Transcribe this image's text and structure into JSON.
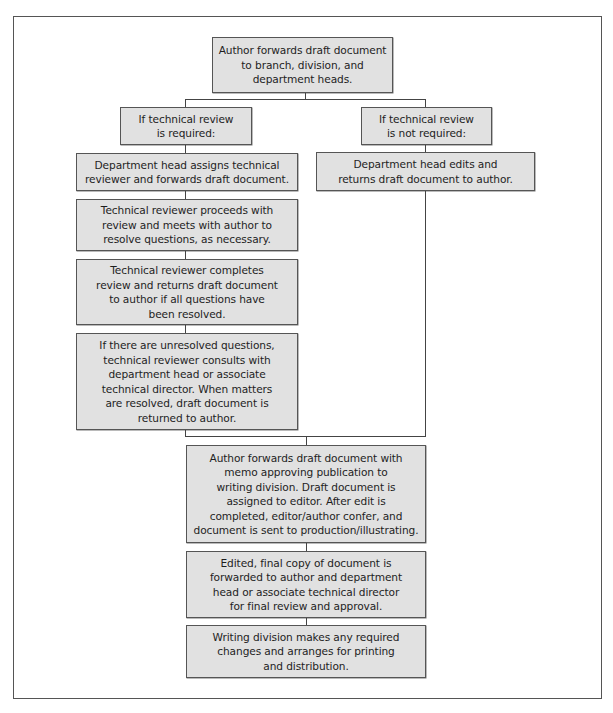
{
  "diagram": {
    "type": "flowchart",
    "style": {
      "node_fill": "#e1e1e1",
      "node_border": "#555555",
      "line_color": "#444444",
      "frame_border": "#555555"
    },
    "nodes": {
      "start": {
        "text": "Author forwards draft document\nto branch, division, and\ndepartment heads."
      },
      "review_required": {
        "text": "If technical review\nis required:"
      },
      "review_not_required": {
        "text": "If technical review\nis not required:"
      },
      "assign_reviewer": {
        "text": "Department head assigns technical\nreviewer and forwards draft document."
      },
      "dept_head_edits": {
        "text": "Department head edits and\nreturns draft document to author."
      },
      "reviewer_proceeds": {
        "text": "Technical reviewer proceeds with\nreview and meets with author to\nresolve questions, as necessary."
      },
      "reviewer_completes": {
        "text": "Technical reviewer completes\nreview and returns draft document\nto author if all questions have\nbeen resolved."
      },
      "unresolved": {
        "text": "If there are unresolved questions,\ntechnical reviewer consults with\ndepartment head or associate\ntechnical director. When matters\nare resolved, draft document is\nreturned to author."
      },
      "forward_to_writing": {
        "text": "Author forwards draft document with\nmemo approving publication to\nwriting division. Draft document is\nassigned to editor. After edit is\ncompleted, editor/author confer, and\ndocument is sent to production/illustrating."
      },
      "final_copy": {
        "text": "Edited, final copy of document is\nforwarded to author and department\nhead or associate technical director\nfor final review and approval."
      },
      "printing": {
        "text": "Writing division makes any required\nchanges and arranges for printing\nand distribution."
      }
    },
    "edges": [
      [
        "start",
        "review_required"
      ],
      [
        "start",
        "review_not_required"
      ],
      [
        "review_required",
        "assign_reviewer"
      ],
      [
        "review_not_required",
        "dept_head_edits"
      ],
      [
        "assign_reviewer",
        "reviewer_proceeds"
      ],
      [
        "reviewer_proceeds",
        "reviewer_completes"
      ],
      [
        "reviewer_completes",
        "unresolved"
      ],
      [
        "unresolved",
        "forward_to_writing"
      ],
      [
        "dept_head_edits",
        "forward_to_writing"
      ],
      [
        "forward_to_writing",
        "final_copy"
      ],
      [
        "final_copy",
        "printing"
      ]
    ]
  }
}
